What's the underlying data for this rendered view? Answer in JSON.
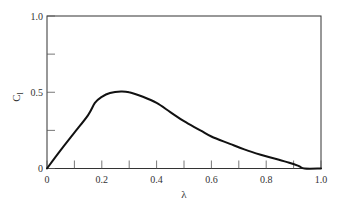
{
  "chart_data": {
    "type": "line",
    "title": "",
    "xlabel": "λ",
    "ylabel": "C",
    "ylabel_subscript": "l",
    "xlim": [
      0,
      1.0
    ],
    "ylim": [
      0,
      1.0
    ],
    "grid": false,
    "legend": null,
    "x_ticks": [
      0,
      0.1,
      0.2,
      0.3,
      0.4,
      0.5,
      0.6,
      0.7,
      0.8,
      0.9,
      1.0
    ],
    "x_tick_labels": [
      "0",
      "0.2",
      "0.4",
      "0.6",
      "0.8",
      "1.0"
    ],
    "x_tick_label_values": [
      0,
      0.2,
      0.4,
      0.6,
      0.8,
      1.0
    ],
    "y_ticks": [
      0,
      0.25,
      0.5,
      0.75,
      1.0
    ],
    "y_tick_labels": [
      "0",
      "0.5",
      "1.0"
    ],
    "y_tick_label_values": [
      0,
      0.5,
      1.0
    ],
    "series": [
      {
        "name": "C_l",
        "color": "#111111",
        "x": [
          0,
          0.05,
          0.1,
          0.15,
          0.175,
          0.2,
          0.23,
          0.27,
          0.3,
          0.35,
          0.4,
          0.45,
          0.5,
          0.56,
          0.6,
          0.67,
          0.72,
          0.78,
          0.84,
          0.89,
          0.92,
          0.94,
          1.0
        ],
        "values": [
          0,
          0.12,
          0.235,
          0.35,
          0.43,
          0.47,
          0.495,
          0.505,
          0.5,
          0.47,
          0.43,
          0.37,
          0.31,
          0.25,
          0.21,
          0.16,
          0.125,
          0.09,
          0.06,
          0.035,
          0.015,
          0.0,
          0.0
        ]
      }
    ]
  }
}
